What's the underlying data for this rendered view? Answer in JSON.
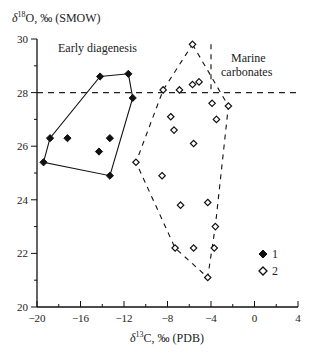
{
  "chart_data": {
    "type": "scatter",
    "title": "",
    "xlabel": "δ13C, ‰ (PDB)",
    "ylabel": "δ18O, ‰ (SMOW)",
    "xlim": [
      -20,
      4
    ],
    "ylim": [
      20,
      30
    ],
    "x_ticks": [
      -20,
      -16,
      -12,
      -8,
      -4,
      0,
      4
    ],
    "y_ticks": [
      20,
      22,
      24,
      26,
      28,
      30
    ],
    "x_tick_labels": [
      "−20",
      "−16",
      "−12",
      "−8",
      "−4",
      "0",
      "4"
    ],
    "y_tick_labels": [
      "20",
      "22",
      "24",
      "26",
      "28",
      "30"
    ],
    "grid": false,
    "legend_position": "lower right",
    "legend": [
      {
        "label": "1",
        "marker": "filled-diamond"
      },
      {
        "label": "2",
        "marker": "open-diamond"
      }
    ],
    "annotations": [
      {
        "text": "Early diagenesis",
        "x": -15.5,
        "y": 29.5
      },
      {
        "text": "Marine",
        "x": -0.3,
        "y": 28.9
      },
      {
        "text": "carbonates",
        "x": -0.3,
        "y": 28.4
      }
    ],
    "reference_lines": [
      {
        "orientation": "horizontal",
        "value": 28,
        "style": "dashed"
      },
      {
        "orientation": "vertical",
        "value": -4,
        "ymin": 28,
        "ymax": 29.8,
        "style": "dashed"
      }
    ],
    "series": [
      {
        "name": "1",
        "marker": "filled-diamond",
        "points": [
          {
            "x": -19.4,
            "y": 25.4
          },
          {
            "x": -18.8,
            "y": 26.3
          },
          {
            "x": -17.2,
            "y": 26.3
          },
          {
            "x": -14.2,
            "y": 28.6
          },
          {
            "x": -11.6,
            "y": 28.7
          },
          {
            "x": -11.2,
            "y": 27.8
          },
          {
            "x": -13.3,
            "y": 26.3
          },
          {
            "x": -14.3,
            "y": 25.8
          },
          {
            "x": -13.3,
            "y": 24.9
          }
        ],
        "envelope": {
          "style": "solid",
          "label": "Early diagenesis",
          "vertices": [
            {
              "x": -19.4,
              "y": 25.4
            },
            {
              "x": -18.8,
              "y": 26.3
            },
            {
              "x": -14.2,
              "y": 28.6
            },
            {
              "x": -11.6,
              "y": 28.7
            },
            {
              "x": -11.2,
              "y": 27.8
            },
            {
              "x": -13.3,
              "y": 24.9
            }
          ]
        }
      },
      {
        "name": "2",
        "marker": "open-diamond",
        "points": [
          {
            "x": -5.7,
            "y": 29.8
          },
          {
            "x": -8.4,
            "y": 28.1
          },
          {
            "x": -6.9,
            "y": 28.1
          },
          {
            "x": -5.7,
            "y": 28.3
          },
          {
            "x": -5.1,
            "y": 28.4
          },
          {
            "x": -3.9,
            "y": 27.6
          },
          {
            "x": -2.4,
            "y": 27.5
          },
          {
            "x": -7.7,
            "y": 27.1
          },
          {
            "x": -7.4,
            "y": 26.6
          },
          {
            "x": -3.5,
            "y": 27.0
          },
          {
            "x": -5.6,
            "y": 26.1
          },
          {
            "x": -10.9,
            "y": 25.4
          },
          {
            "x": -8.5,
            "y": 24.9
          },
          {
            "x": -6.8,
            "y": 23.8
          },
          {
            "x": -4.3,
            "y": 23.9
          },
          {
            "x": -3.6,
            "y": 23.0
          },
          {
            "x": -7.3,
            "y": 22.2
          },
          {
            "x": -5.6,
            "y": 22.2
          },
          {
            "x": -3.7,
            "y": 22.2
          },
          {
            "x": -4.3,
            "y": 21.1
          }
        ],
        "envelope": {
          "style": "dashed",
          "label": "Marine carbonates",
          "vertices": [
            {
              "x": -5.7,
              "y": 29.8
            },
            {
              "x": -2.4,
              "y": 27.5
            },
            {
              "x": -3.6,
              "y": 23.0
            },
            {
              "x": -4.3,
              "y": 21.1
            },
            {
              "x": -7.3,
              "y": 22.2
            },
            {
              "x": -10.9,
              "y": 25.4
            },
            {
              "x": -8.4,
              "y": 28.1
            }
          ]
        }
      }
    ]
  },
  "labels": {
    "y_axis_title_delta": "δ",
    "y_axis_title_sup": "18",
    "y_axis_title_rest": "O, ‰ (SMOW)",
    "x_axis_title_delta": "δ",
    "x_axis_title_sup": "13",
    "x_axis_title_rest": "C, ‰ (PDB)",
    "early": "Early diagenesis",
    "marine1": "Marine",
    "marine2": "carbonates",
    "legend1": "1",
    "legend2": "2"
  }
}
